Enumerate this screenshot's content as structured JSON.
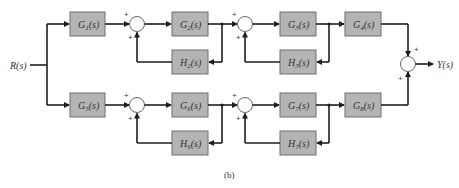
{
  "diagram": {
    "input_label": "R(s)",
    "output_label": "Y(s)",
    "caption": "(b)",
    "top_path": {
      "forward_blocks": [
        "G1(s)",
        "G2(s)",
        "G3(s)",
        "G4(s)"
      ],
      "feedback_blocks": [
        "H2(s)",
        "H3(s)"
      ]
    },
    "bottom_path": {
      "forward_blocks": [
        "G5(s)",
        "G6(s)",
        "G7(s)",
        "G8(s)"
      ],
      "feedback_blocks": [
        "H6(s)",
        "H7(s)"
      ]
    },
    "labels": {
      "G1": "G",
      "G1_sub": "1",
      "G2": "G",
      "G2_sub": "2",
      "G3": "G",
      "G3_sub": "3",
      "G4": "G",
      "G4_sub": "4",
      "H2": "H",
      "H2_sub": "2",
      "H3": "H",
      "H3_sub": "3",
      "G5": "G",
      "G5_sub": "5",
      "G6": "G",
      "G6_sub": "6",
      "G7": "G",
      "G7_sub": "7",
      "G8": "G",
      "G8_sub": "8",
      "H6": "H",
      "H6_sub": "6",
      "H7": "H",
      "H7_sub": "7",
      "suffix": "(s)"
    },
    "summing_junction_signs": "+",
    "colors": {
      "block_fill": "#b4b4b4",
      "line": "#1e1e1e",
      "background": "#ffffff"
    }
  }
}
